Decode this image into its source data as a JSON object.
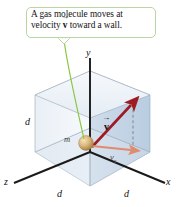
{
  "figure": {
    "background_color": "#ffffff",
    "callout": {
      "text_line1": "A gas molecule moves at",
      "text_line2_prefix": "velocity ",
      "text_line2_vector": "v",
      "text_line2_suffix": " toward a wall.",
      "full_text": "A gas molecule moves at velocity v⃗ toward a wall.",
      "border_color": "#b9d6a2",
      "text_color": "#141414",
      "leader_line_color": "#8cc63f"
    },
    "axes": {
      "y_label": "y",
      "x_label": "x",
      "z_label": "z",
      "axis_color": "#1a1a1a"
    },
    "dimensions": {
      "left_label": "d",
      "front_left_label": "d",
      "front_right_label": "d",
      "edge_length_symbol": "d"
    },
    "molecule": {
      "mass_label": "m",
      "sphere_color": "#d8b87e",
      "sphere_highlight": "#f0dcb4",
      "sphere_shadow": "#a8823f"
    },
    "vectors": {
      "velocity_label": "v",
      "velocity_color": "#9e1b24",
      "component_label": "v",
      "component_subscript": "x",
      "component_color": "#e08a6e",
      "dashed_guide_color": "#8d8d8d"
    },
    "cube": {
      "left_face_color": "#eef3f8",
      "right_face_color": "#c9d8e8",
      "top_face_color": "#f2f6fa",
      "floor_color": "#dde6f0",
      "edge_color": "#9aa8b8"
    }
  }
}
